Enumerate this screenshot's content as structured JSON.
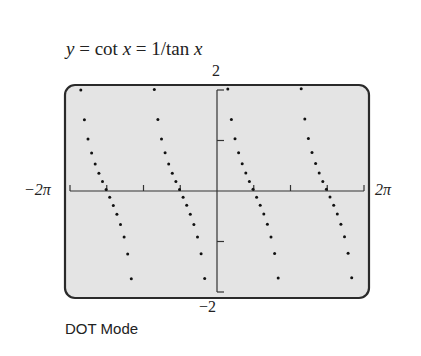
{
  "title": {
    "y": "y",
    "eq1": " = cot ",
    "x1": "x",
    "eq2": " = 1/tan ",
    "x2": "x"
  },
  "labels": {
    "ymax": "2",
    "ymin": "−2",
    "xmin": "−2π",
    "xmax": "2π",
    "mode": "DOT Mode"
  },
  "colors": {
    "screen_bg": "#e4e4e4",
    "frame": "#2a2a2a",
    "axis": "#333333",
    "dot": "#111111"
  },
  "chart_data": {
    "type": "scatter",
    "title": "y = cot x = 1/tan x",
    "function": "cot(x)",
    "mode": "DOT",
    "xlabel": "",
    "ylabel": "",
    "xlim": [
      -6.2832,
      6.2832
    ],
    "ylim": [
      -2,
      2
    ],
    "x_tick_labels": [
      "-2π",
      "2π"
    ],
    "x_tick_spacing": "π/2",
    "y_tick_labels": [
      "-2",
      "2"
    ],
    "y_tick_spacing": 1,
    "grid": false,
    "asymptotes": [
      -6.2832,
      -3.1416,
      0,
      3.1416,
      6.2832
    ],
    "branches": [
      {
        "x_start": -5.82,
        "x_end": -3.6
      },
      {
        "x_start": -2.68,
        "x_end": -0.46
      },
      {
        "x_start": 0.46,
        "x_end": 2.68
      },
      {
        "x_start": 3.6,
        "x_end": 5.82
      }
    ],
    "sample_points": [
      {
        "x": -5.82,
        "y": 2.0
      },
      {
        "x": -5.5,
        "y": 1.0
      },
      {
        "x": -4.71,
        "y": 0.0
      },
      {
        "x": -3.93,
        "y": -1.0
      },
      {
        "x": -3.6,
        "y": -2.0
      },
      {
        "x": -2.68,
        "y": 2.0
      },
      {
        "x": -2.36,
        "y": 1.0
      },
      {
        "x": -1.57,
        "y": 0.0
      },
      {
        "x": -0.79,
        "y": -1.0
      },
      {
        "x": -0.46,
        "y": -2.0
      },
      {
        "x": 0.46,
        "y": 2.0
      },
      {
        "x": 0.79,
        "y": 1.0
      },
      {
        "x": 1.57,
        "y": 0.0
      },
      {
        "x": 2.36,
        "y": -1.0
      },
      {
        "x": 2.68,
        "y": -2.0
      },
      {
        "x": 3.6,
        "y": 2.0
      },
      {
        "x": 3.93,
        "y": 1.0
      },
      {
        "x": 4.71,
        "y": 0.0
      },
      {
        "x": 5.5,
        "y": -1.0
      },
      {
        "x": 5.82,
        "y": -2.0
      }
    ],
    "dot_step_x": 0.154
  },
  "layout": {
    "frame": {
      "x": 65,
      "y": 85,
      "w": 304,
      "h": 213,
      "r": 10
    },
    "plot": {
      "x0": 70,
      "x1": 364,
      "y0": 90,
      "y1": 292
    }
  }
}
